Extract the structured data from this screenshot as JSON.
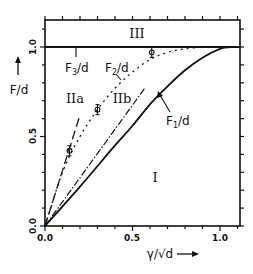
{
  "chart_data": {
    "type": "line",
    "title": "",
    "xlabel": "γ/√d",
    "ylabel": "F/d",
    "xlim": [
      0.0,
      1.11
    ],
    "ylim": [
      0.0,
      1.15
    ],
    "grid": false,
    "legend": "none (curves labeled inline)",
    "x_ticks": [
      "0.0",
      "0.5",
      "1.0"
    ],
    "y_ticks": [
      "0.0",
      "0.5",
      "1.0"
    ],
    "series": [
      {
        "name": "F1/d",
        "style": "solid",
        "x": [
          0.0,
          0.2,
          0.4,
          0.5,
          0.6,
          0.7,
          0.8,
          0.9,
          1.0,
          1.08
        ],
        "y": [
          0.0,
          0.22,
          0.45,
          0.56,
          0.68,
          0.78,
          0.87,
          0.94,
          0.99,
          1.0
        ]
      },
      {
        "name": "F2/d",
        "style": "dotted",
        "x": [
          0.0,
          0.1,
          0.2,
          0.3,
          0.4,
          0.5,
          0.6,
          0.7,
          0.8,
          0.9
        ],
        "y": [
          0.0,
          0.3,
          0.5,
          0.65,
          0.77,
          0.86,
          0.93,
          0.97,
          0.99,
          1.0
        ]
      },
      {
        "name": "F3/d",
        "style": "solid-horizontal",
        "x": [
          0.0,
          1.11
        ],
        "y": [
          1.0,
          1.0
        ]
      },
      {
        "name": "initial slope (F2)",
        "style": "long-dash",
        "x": [
          0.0,
          0.2
        ],
        "y": [
          0.0,
          0.62
        ]
      },
      {
        "name": "initial slope (F1)",
        "style": "dash-dot",
        "x": [
          0.0,
          0.57
        ],
        "y": [
          0.0,
          0.77
        ]
      }
    ],
    "data_points": {
      "name": "measured",
      "marker": "circle-with-errorbar",
      "x": [
        0.14,
        0.3,
        0.61
      ],
      "y": [
        0.42,
        0.65,
        0.97
      ]
    },
    "annotations": [
      {
        "text": "III",
        "x": 0.52,
        "y": 1.07,
        "role": "region"
      },
      {
        "text": "IIa",
        "x": 0.17,
        "y": 0.69,
        "role": "region"
      },
      {
        "text": "IIb",
        "x": 0.44,
        "y": 0.69,
        "role": "region"
      },
      {
        "text": "I",
        "x": 0.63,
        "y": 0.27,
        "role": "region"
      },
      {
        "text": "F3/d",
        "x": 0.12,
        "y": 0.87,
        "role": "curve-label"
      },
      {
        "text": "F2/d",
        "x": 0.35,
        "y": 0.87,
        "role": "curve-label"
      },
      {
        "text": "F1/d",
        "x": 0.75,
        "y": 0.46,
        "role": "curve-label"
      }
    ]
  },
  "labels": {
    "ylabel": "F/d",
    "xlabel": "γ/√d",
    "xticks": [
      "0.0",
      "0.5",
      "1.0"
    ],
    "yticks": [
      "0.0",
      "0.5",
      "1.0"
    ],
    "region_III": "III",
    "region_IIa": "IIa",
    "region_IIb": "IIb",
    "region_I": "I",
    "f3_label_main": "F",
    "f3_label_sub": "3",
    "f2_label_main": "F",
    "f2_label_sub": "2",
    "f1_label_main": "F",
    "f1_label_sub": "1",
    "over_d": "/d"
  }
}
